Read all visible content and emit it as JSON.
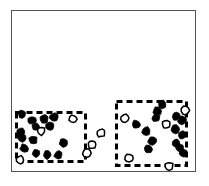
{
  "figure": {
    "width": 209,
    "height": 186,
    "background": "#ffffff",
    "caption": ""
  },
  "frame": {
    "label": "plot-frame",
    "x": 11,
    "y": 10,
    "width": 185,
    "height": 162,
    "border_color": "#555555",
    "border_width": 1.4,
    "fill": "#ffffff"
  },
  "clusters": [
    {
      "name": "left-cluster",
      "label": "",
      "x": 15,
      "y": 111,
      "width": 72,
      "height": 52,
      "border_color": "#000000",
      "border_width": 3,
      "border_style": "dashed",
      "dash_pattern": "6 4"
    },
    {
      "name": "right-cluster",
      "label": "",
      "x": 115,
      "y": 100,
      "width": 73,
      "height": 67,
      "border_color": "#000000",
      "border_width": 3,
      "border_style": "dashed",
      "dash_pattern": "6 4"
    }
  ],
  "chart_data": {
    "type": "scatter",
    "title": "",
    "subtitle": "",
    "xlabel": "",
    "ylabel": "",
    "xlim": [
      11,
      196
    ],
    "ylim": [
      10,
      172
    ],
    "grid": false,
    "legend": null,
    "marker_colors": {
      "filled": "#000000",
      "hollow": "#ffffff",
      "outline": "#000000"
    },
    "series": [
      {
        "name": "filled-points",
        "style": "filled",
        "count": 28,
        "points": [
          {
            "x": 22,
            "y": 114,
            "r": 4.0
          },
          {
            "x": 32,
            "y": 120,
            "r": 4.2
          },
          {
            "x": 44,
            "y": 119,
            "r": 4.2
          },
          {
            "x": 54,
            "y": 117,
            "r": 4.0
          },
          {
            "x": 21,
            "y": 132,
            "r": 4.2
          },
          {
            "x": 36,
            "y": 127,
            "r": 3.8
          },
          {
            "x": 50,
            "y": 126,
            "r": 4.2
          },
          {
            "x": 22,
            "y": 138,
            "r": 4.0
          },
          {
            "x": 33,
            "y": 140,
            "r": 4.2
          },
          {
            "x": 24,
            "y": 148,
            "r": 4.2
          },
          {
            "x": 36,
            "y": 153,
            "r": 4.2
          },
          {
            "x": 47,
            "y": 155,
            "r": 4.0
          },
          {
            "x": 58,
            "y": 155,
            "r": 4.2
          },
          {
            "x": 63,
            "y": 143,
            "r": 4.2
          },
          {
            "x": 162,
            "y": 104,
            "r": 4.2
          },
          {
            "x": 157,
            "y": 111,
            "r": 4.2
          },
          {
            "x": 176,
            "y": 116,
            "r": 4.2
          },
          {
            "x": 182,
            "y": 120,
            "r": 4.2
          },
          {
            "x": 156,
            "y": 118,
            "r": 4.0
          },
          {
            "x": 136,
            "y": 124,
            "r": 4.2
          },
          {
            "x": 146,
            "y": 131,
            "r": 4.2
          },
          {
            "x": 175,
            "y": 129,
            "r": 4.2
          },
          {
            "x": 182,
            "y": 135,
            "r": 4.2
          },
          {
            "x": 152,
            "y": 141,
            "r": 4.2
          },
          {
            "x": 176,
            "y": 143,
            "r": 4.2
          },
          {
            "x": 148,
            "y": 149,
            "r": 4.2
          },
          {
            "x": 180,
            "y": 148,
            "r": 4.0
          },
          {
            "x": 183,
            "y": 153,
            "r": 4.0
          }
        ]
      },
      {
        "name": "hollow-points",
        "style": "hollow",
        "count": 11,
        "points": [
          {
            "x": 41,
            "y": 131,
            "r": 4.0
          },
          {
            "x": 73,
            "y": 119,
            "r": 4.0
          },
          {
            "x": 20,
            "y": 160,
            "r": 4.0
          },
          {
            "x": 87,
            "y": 153,
            "r": 4.0
          },
          {
            "x": 101,
            "y": 133,
            "r": 4.0
          },
          {
            "x": 92,
            "y": 145,
            "r": 3.8
          },
          {
            "x": 125,
            "y": 118,
            "r": 4.2
          },
          {
            "x": 185,
            "y": 110,
            "r": 4.2
          },
          {
            "x": 166,
            "y": 124,
            "r": 4.2
          },
          {
            "x": 129,
            "y": 158,
            "r": 4.0
          },
          {
            "x": 169,
            "y": 166,
            "r": 4.0
          }
        ]
      }
    ]
  }
}
